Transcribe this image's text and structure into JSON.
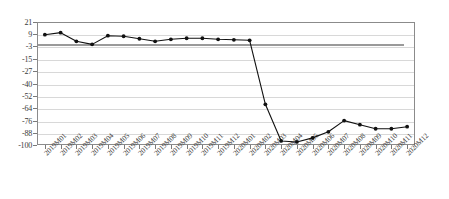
{
  "chart_data": {
    "type": "line",
    "title": "",
    "subtitle": "",
    "xlabel": "",
    "ylabel": "",
    "grid": true,
    "legend": "none",
    "ylim": [
      -100,
      21
    ],
    "yticks": [
      21,
      9,
      -3,
      -15,
      -27,
      -40,
      -52,
      -64,
      -76,
      -88,
      -100
    ],
    "ytick_labels": [
      "21",
      "9",
      "-3",
      "-15",
      "-27",
      "-40",
      "-52",
      "-64",
      "-76",
      "-88",
      "-100"
    ],
    "reference_line": 0,
    "categories": [
      "2019M01",
      "2019M02",
      "2019M03",
      "2019M04",
      "2019M05",
      "2019M06",
      "2019M07",
      "2019M08",
      "2019M09",
      "2019M10",
      "2019M11",
      "2019M12",
      "2020M01",
      "2020M02",
      "2020M03",
      "2020M04",
      "2020M05",
      "2020M06",
      "2020M07",
      "2020M08",
      "2020M09",
      "2020M10",
      "2020M11",
      "2020M12"
    ],
    "values": [
      8.5,
      10.5,
      2.0,
      -1.0,
      7.5,
      7.0,
      4.5,
      2.0,
      4.0,
      5.0,
      5.0,
      4.0,
      3.5,
      3.0,
      -60.0,
      -96.0,
      -97.0,
      -93.0,
      -87.0,
      -76.0,
      -80.0,
      -84.0,
      -84.0,
      -82.0
    ],
    "series_name": "index",
    "marker": "filled-circle",
    "line_color": "#111111",
    "grid_color": "#d8d8d8",
    "frame_color": "#8b8b8b",
    "background_color": "#ffffff"
  }
}
